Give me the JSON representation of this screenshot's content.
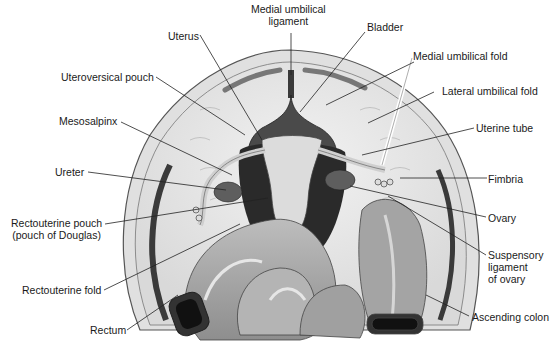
{
  "diagram": {
    "labels": [
      {
        "id": "medial-umbilical-ligament",
        "text": "Medial umbilical\nligament",
        "line1": "Medial umbilical",
        "line2": "ligament"
      },
      {
        "id": "bladder",
        "text": "Bladder"
      },
      {
        "id": "uterus",
        "text": "Uterus"
      },
      {
        "id": "medial-umbilical-fold",
        "text": "Medial umbilical fold"
      },
      {
        "id": "uteroversical-pouch",
        "text": "Uteroversical pouch"
      },
      {
        "id": "lateral-umbilical-fold",
        "text": "Lateral umbilical fold"
      },
      {
        "id": "mesosalpinx",
        "text": "Mesosalpinx"
      },
      {
        "id": "uterine-tube",
        "text": "Uterine tube"
      },
      {
        "id": "ureter",
        "text": "Ureter"
      },
      {
        "id": "fimbria",
        "text": "Fimbria"
      },
      {
        "id": "rectouterine-pouch",
        "line1": "Rectouterine pouch",
        "line2": "(pouch of Douglas)"
      },
      {
        "id": "ovary",
        "text": "Ovary"
      },
      {
        "id": "suspensory-ligament",
        "line1": "Suspensory",
        "line2": "ligament",
        "line3": "of ovary"
      },
      {
        "id": "rectouterine-fold",
        "text": "Rectouterine fold"
      },
      {
        "id": "rectum",
        "text": "Rectum"
      },
      {
        "id": "ascending-colon",
        "text": "Ascending colon"
      }
    ]
  },
  "colors": {
    "background": "#ffffff",
    "peritoneum": "#e6e6e6",
    "wall_outline": "#555555",
    "dark_organ": "#3a3a3a",
    "uterus": "#d8d8d8",
    "ovary": "#5e5e5e",
    "intestine": "#a8a8a8",
    "intestine_highlight": "#cfcfcf",
    "leader_line": "#222222"
  }
}
